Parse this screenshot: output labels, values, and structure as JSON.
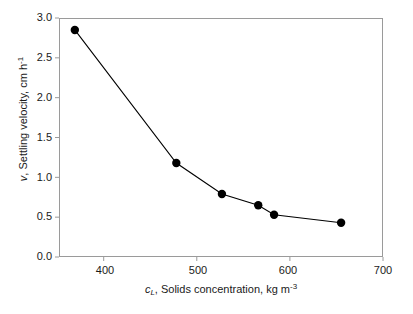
{
  "chart_data": {
    "type": "line",
    "title": "",
    "subtitle": "",
    "xlabel": "c_L, Solids concentration, kg m^-3",
    "ylabel": "v, Settling velocity, cm h^-1",
    "xlim": [
      352,
      700
    ],
    "ylim": [
      0.0,
      3.0
    ],
    "grid": false,
    "legend": "none",
    "marker": "filled-circle",
    "line_color": "#000000",
    "marker_color": "#000000",
    "frame_color": "#9a9a9a",
    "x": [
      369,
      478,
      527,
      566,
      583,
      655
    ],
    "y": [
      2.85,
      1.18,
      0.79,
      0.65,
      0.53,
      0.43
    ],
    "points": [
      {
        "x": 369,
        "y": 2.85
      },
      {
        "x": 478,
        "y": 1.18
      },
      {
        "x": 527,
        "y": 0.79
      },
      {
        "x": 566,
        "y": 0.65
      },
      {
        "x": 583,
        "y": 0.53
      },
      {
        "x": 655,
        "y": 0.43
      }
    ],
    "xticks": [
      400,
      500,
      600,
      700
    ],
    "xtick_labels": [
      "400",
      "500",
      "600",
      "700"
    ],
    "yticks": [
      0.0,
      0.5,
      1.0,
      1.5,
      2.0,
      2.5,
      3.0
    ],
    "ytick_labels": [
      "0.0",
      "0.5",
      "1.0",
      "1.5",
      "2.0",
      "2.5",
      "3.0"
    ]
  },
  "axes": {
    "y_title": {
      "symbol": "v",
      "text": ", Settling velocity, cm h",
      "exponent": "-1"
    },
    "x_title": {
      "symbol": "c",
      "subscript": "L",
      "text": ", Solids concentration, kg m",
      "exponent": "-3"
    }
  }
}
